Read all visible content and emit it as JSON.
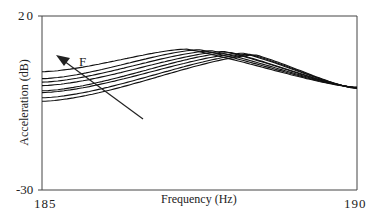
{
  "chart_data": {
    "type": "line",
    "title": "",
    "xlabel": "Frequency (Hz)",
    "ylabel": "Acceleration (dB)",
    "xlim": [
      185,
      190
    ],
    "ylim": [
      -30,
      20
    ],
    "x_ticks": [
      "185",
      "190"
    ],
    "y_ticks": [
      "20",
      "-30"
    ],
    "grid": false,
    "legend": null,
    "annotation": {
      "text": "F",
      "arrow": "points up-left, indicating trend of increasing F shifts resonance peak to lower frequency"
    },
    "series": [
      {
        "name": "curve 1",
        "left_db": 4.0,
        "peak_hz": 187.3,
        "peak_db": 10.5,
        "right_db": -0.5
      },
      {
        "name": "curve 2",
        "left_db": 2.0,
        "peak_hz": 187.5,
        "peak_db": 10.3,
        "right_db": -0.5
      },
      {
        "name": "curve 3",
        "left_db": 1.0,
        "peak_hz": 187.7,
        "peak_db": 10.0,
        "right_db": -0.5
      },
      {
        "name": "curve 4",
        "left_db": 0.0,
        "peak_hz": 187.9,
        "peak_db": 9.8,
        "right_db": -0.6
      },
      {
        "name": "curve 5",
        "left_db": -1.5,
        "peak_hz": 188.0,
        "peak_db": 9.5,
        "right_db": -0.6
      },
      {
        "name": "curve 6",
        "left_db": -2.0,
        "peak_hz": 188.2,
        "peak_db": 9.3,
        "right_db": -0.7
      },
      {
        "name": "curve 7",
        "left_db": -3.5,
        "peak_hz": 188.3,
        "peak_db": 9.0,
        "right_db": -0.7
      },
      {
        "name": "curve 8",
        "left_db": -4.5,
        "peak_hz": 188.4,
        "peak_db": 8.8,
        "right_db": -0.8
      }
    ]
  },
  "labels": {
    "y_top": "20",
    "y_bottom": "-30",
    "x_left": "185",
    "x_right": "190",
    "xlabel": "Frequency (Hz)",
    "ylabel": "Acceleration (dB)",
    "arrow_label": "F"
  }
}
